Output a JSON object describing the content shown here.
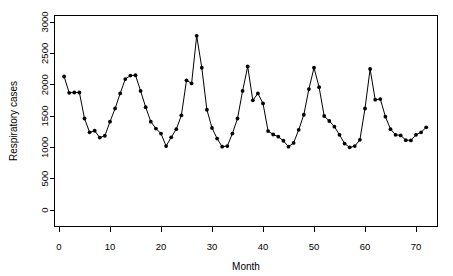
{
  "chart_data": {
    "type": "line",
    "title": "",
    "subtitle": "",
    "xlabel": "Month",
    "ylabel": "Respiratory cases",
    "xlim": [
      0,
      75
    ],
    "ylim": [
      0,
      3100
    ],
    "grid": false,
    "legend": null,
    "marker": "filled-circle",
    "line_color": "#000000",
    "xticks": [
      0,
      10,
      20,
      30,
      40,
      50,
      60,
      70
    ],
    "xtick_labels": [
      "0",
      "10",
      "20",
      "30",
      "40",
      "50",
      "60",
      "70"
    ],
    "yticks": [
      0,
      500,
      1000,
      1500,
      2000,
      2500,
      3000
    ],
    "ytick_labels": [
      "0",
      "500",
      "1000",
      "1500",
      "2000",
      "2500",
      "3000"
    ],
    "x": [
      1,
      2,
      3,
      4,
      5,
      6,
      7,
      8,
      9,
      10,
      11,
      12,
      13,
      14,
      15,
      16,
      17,
      18,
      19,
      20,
      21,
      22,
      23,
      24,
      25,
      26,
      27,
      28,
      29,
      30,
      31,
      32,
      33,
      34,
      35,
      36,
      37,
      38,
      39,
      40,
      41,
      42,
      43,
      44,
      45,
      46,
      47,
      48,
      49,
      50,
      51,
      52,
      53,
      54,
      55,
      56,
      57,
      58,
      59,
      60,
      61,
      62,
      63,
      64,
      65,
      66,
      67,
      68,
      69,
      70,
      71,
      72
    ],
    "values": [
      2130,
      1870,
      1875,
      1875,
      1460,
      1240,
      1265,
      1155,
      1185,
      1410,
      1620,
      1860,
      2090,
      2145,
      2150,
      1900,
      1640,
      1410,
      1300,
      1220,
      1020,
      1160,
      1290,
      1510,
      2070,
      2020,
      2780,
      2270,
      1600,
      1310,
      1140,
      1010,
      1020,
      1220,
      1460,
      1900,
      2290,
      1750,
      1860,
      1700,
      1260,
      1205,
      1170,
      1105,
      1010,
      1070,
      1280,
      1520,
      1930,
      2270,
      1960,
      1500,
      1420,
      1330,
      1200,
      1060,
      1000,
      1020,
      1120,
      1620,
      2250,
      1760,
      1770,
      1490,
      1290,
      1200,
      1190,
      1115,
      1110,
      1200,
      1240,
      1320
    ],
    "series_name": "Respiratory cases"
  }
}
